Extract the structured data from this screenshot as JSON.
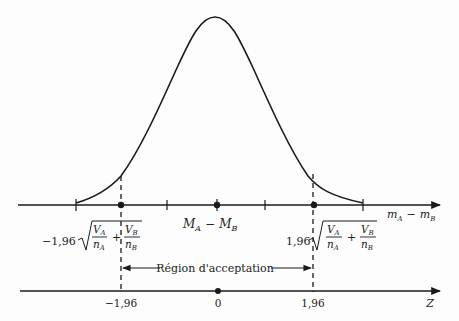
{
  "diagram": {
    "type": "normal-distribution-acceptance-region",
    "colors": {
      "ink": "#1a1a1a",
      "background": "#fdfdfd"
    },
    "upper_axis": {
      "label": "m_A − m_B",
      "label_main_left": "m",
      "label_sub_left": "A",
      "label_minus": "−",
      "label_main_right": "m",
      "label_sub_right": "B",
      "center_label_M": "M",
      "center_sub_A": "A",
      "center_minus": "−",
      "center_sub_B": "B",
      "left_bound_coef": "−1,96",
      "right_bound_coef": "1,96",
      "frac1_num": "V",
      "frac1_num_sub": "A",
      "frac1_den": "n",
      "frac1_den_sub": "A",
      "plus": "+",
      "frac2_num": "V",
      "frac2_num_sub": "B",
      "frac2_den": "n",
      "frac2_den_sub": "B"
    },
    "lower_axis": {
      "label": "Z",
      "ticks": [
        "−1,96",
        "0",
        "1,96"
      ]
    },
    "acceptance_region_label": "Région d'acceptation"
  }
}
